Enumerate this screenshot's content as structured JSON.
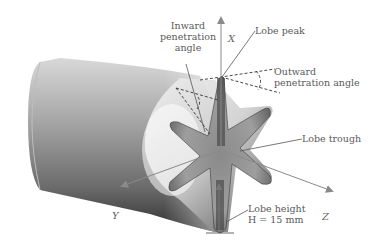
{
  "figure": {
    "labels": {
      "inward_line1": "Inward",
      "inward_line2": "penetration",
      "inward_line3": "angle",
      "lobe_peak": "Lobe peak",
      "outward_line1": "Outward",
      "outward_line2": "penetration angle",
      "lobe_trough": "Lobe trough",
      "lobe_height_line1": "Lobe height",
      "lobe_height_line2": "H = 15 mm"
    },
    "axes": {
      "x": "X",
      "y": "Y",
      "z": "Z"
    },
    "lobe_count": 6,
    "lobe_height_mm": 15,
    "colors": {
      "background": "#ffffff",
      "body_dark": "#3c3c3c",
      "body_light": "#eeeeee",
      "axis_arrow": "#8a8a8a",
      "dashed": "#333333",
      "text": "#5a5a5a"
    }
  }
}
